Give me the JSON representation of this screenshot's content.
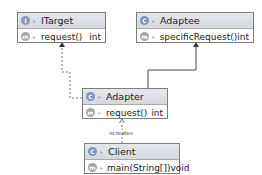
{
  "diagram": {
    "classes": [
      {
        "id": "itarget",
        "kind": "interface",
        "kind_icon": "I",
        "name": "ITarget",
        "members": [
          {
            "kind_icon": "m",
            "name": "request()",
            "type": "int"
          }
        ]
      },
      {
        "id": "adaptee",
        "kind": "class",
        "kind_icon": "C",
        "name": "Adaptee",
        "members": [
          {
            "kind_icon": "m",
            "name": "specificRequest()",
            "type": "int"
          }
        ]
      },
      {
        "id": "adapter",
        "kind": "class",
        "kind_icon": "C",
        "name": "Adapter",
        "members": [
          {
            "kind_icon": "m",
            "name": "request()",
            "type": "int"
          }
        ]
      },
      {
        "id": "client",
        "kind": "class",
        "kind_icon": "C",
        "name": "Client",
        "members": [
          {
            "kind_icon": "m",
            "name": "main(String[])",
            "type": "void"
          }
        ]
      }
    ],
    "relations": [
      {
        "from": "Adapter",
        "to": "ITarget",
        "type": "realization",
        "style": "dashed"
      },
      {
        "from": "Adapter",
        "to": "Adaptee",
        "type": "inheritance",
        "style": "solid"
      },
      {
        "from": "Client",
        "to": "Adapter",
        "type": "dependency",
        "style": "dashed",
        "label": "«create»"
      }
    ],
    "colors": {
      "header_bg": "#d9dde3",
      "border": "#7d7d7d",
      "line": "#333333"
    }
  }
}
